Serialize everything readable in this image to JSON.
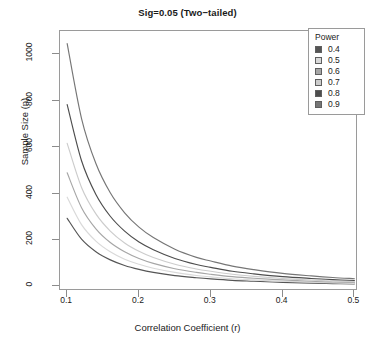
{
  "chart_data": {
    "type": "line",
    "title": "Sig=0.05 (Two−tailed)",
    "xlabel": "Correlation Coefficient (r)",
    "ylabel": "Sample Size (n)",
    "xlim": [
      0.09,
      0.505
    ],
    "ylim": [
      -20,
      1100
    ],
    "xticks": [
      "0.1",
      "0.2",
      "0.3",
      "0.4",
      "0.5"
    ],
    "xtick_values": [
      0.1,
      0.2,
      0.3,
      0.4,
      0.5
    ],
    "yticks": [
      "0",
      "200",
      "400",
      "600",
      "800",
      "1000"
    ],
    "ytick_values": [
      0,
      200,
      400,
      600,
      800,
      1000
    ],
    "grid": false,
    "legend_position": "top-right",
    "legend_title": "Power",
    "x": [
      0.1,
      0.12,
      0.14,
      0.16,
      0.18,
      0.2,
      0.22,
      0.25,
      0.28,
      0.3,
      0.33,
      0.36,
      0.4,
      0.44,
      0.47,
      0.5
    ],
    "series": [
      {
        "name": "0.4",
        "label": "0.4",
        "color": "#555555",
        "values": [
          293,
          203,
          149,
          114,
          90,
          73,
          60,
          46,
          37,
          32,
          26,
          22,
          17,
          14,
          12,
          11
        ]
      },
      {
        "name": "0.5",
        "label": "0.5",
        "color": "#d9d9d9",
        "values": [
          384,
          266,
          195,
          149,
          117,
          95,
          78,
          60,
          47,
          41,
          33,
          28,
          22,
          18,
          15,
          13
        ]
      },
      {
        "name": "0.6",
        "label": "0.6",
        "color": "#a6a6a6",
        "values": [
          489,
          339,
          248,
          189,
          149,
          120,
          99,
          76,
          60,
          52,
          42,
          35,
          28,
          22,
          19,
          17
        ]
      },
      {
        "name": "0.7",
        "label": "0.7",
        "color": "#cccccc",
        "values": [
          616,
          426,
          312,
          238,
          187,
          151,
          124,
          95,
          75,
          65,
          52,
          43,
          34,
          27,
          23,
          20
        ]
      },
      {
        "name": "0.8",
        "label": "0.8",
        "color": "#4d4d4d",
        "values": [
          783,
          541,
          396,
          302,
          238,
          191,
          158,
          120,
          94,
          82,
          65,
          54,
          42,
          34,
          29,
          25
        ]
      },
      {
        "name": "0.9",
        "label": "0.9",
        "color": "#767676",
        "values": [
          1046,
          723,
          529,
          403,
          317,
          255,
          210,
          160,
          125,
          109,
          87,
          72,
          56,
          45,
          38,
          33
        ]
      }
    ]
  },
  "legend": {
    "title": "Power",
    "items": [
      {
        "label": "0.4",
        "color": "#555555"
      },
      {
        "label": "0.5",
        "color": "#d9d9d9"
      },
      {
        "label": "0.6",
        "color": "#a6a6a6"
      },
      {
        "label": "0.7",
        "color": "#cccccc"
      },
      {
        "label": "0.8",
        "color": "#4d4d4d"
      },
      {
        "label": "0.9",
        "color": "#767676"
      }
    ]
  }
}
